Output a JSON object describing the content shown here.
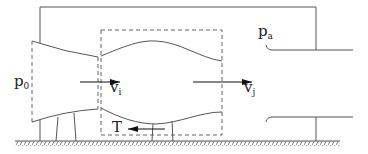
{
  "figure": {
    "labels": {
      "inlet_pressure": {
        "base": "p",
        "sub": "0"
      },
      "ambient_pressure": {
        "base": "p",
        "sub": "a"
      },
      "inlet_velocity": {
        "base": "v",
        "sub": "i"
      },
      "jet_velocity": {
        "base": "v",
        "sub": "j"
      },
      "thrust": "T"
    },
    "colors": {
      "line": "#555555",
      "dashed": "#666666",
      "arrow": "#111111",
      "text": "#222222"
    }
  }
}
